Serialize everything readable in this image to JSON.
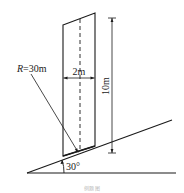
{
  "diagram": {
    "labels": {
      "radius": "R=30m",
      "radius_italic": "R",
      "radius_rest": "=30m",
      "width": "2m",
      "height": "10m",
      "angle": "30°"
    },
    "caption": "例题 图",
    "colors": {
      "stroke": "#1a1a1a",
      "background": "#ffffff",
      "caption": "#b8b8b8"
    }
  }
}
